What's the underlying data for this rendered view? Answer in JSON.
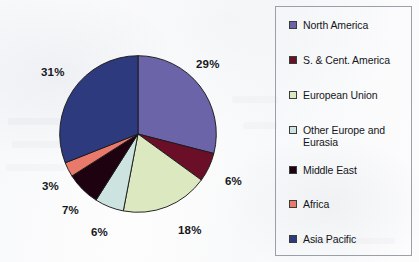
{
  "figure": {
    "kind": "pie-chart-scan",
    "background_color": "#fbfbfc"
  },
  "legend": {
    "position": "right",
    "border_color": "#9aa0a8",
    "items": [
      {
        "label": "North America",
        "color": "#6B64A8",
        "swatch_name": "legend-swatch-north-america"
      },
      {
        "label": "S. & Cent. America",
        "color": "#6B0F28",
        "swatch_name": "legend-swatch-s-cent-america"
      },
      {
        "label": "European Union",
        "color": "#DCE8C0",
        "swatch_name": "legend-swatch-european-union"
      },
      {
        "label": "Other Europe and Eurasia",
        "color": "#CCE3E0",
        "swatch_name": "legend-swatch-other-europe-eurasia"
      },
      {
        "label": "Middle East",
        "color": "#1E0210",
        "swatch_name": "legend-swatch-middle-east"
      },
      {
        "label": "Africa",
        "color": "#E8796B",
        "swatch_name": "legend-swatch-africa"
      },
      {
        "label": "Asia Pacific",
        "color": "#2E3A7E",
        "swatch_name": "legend-swatch-asia-pacific"
      }
    ]
  },
  "labels": {
    "north_america": "29%",
    "s_cent_america": "6%",
    "european_union": "18%",
    "other_europe_and_eurasia": "6%",
    "middle_east": "7%",
    "africa": "3%",
    "asia_pacific": "31%"
  },
  "chart_data": {
    "type": "pie",
    "title": "",
    "subtitle": "",
    "xlabel": "",
    "ylabel": "",
    "units": "percent",
    "start_angle_deg": 0,
    "direction": "clockwise",
    "grid": false,
    "legend_position": "right",
    "categories": [
      "North America",
      "S. & Cent. America",
      "European Union",
      "Other Europe and Eurasia",
      "Middle East",
      "Africa",
      "Asia Pacific"
    ],
    "values": [
      29,
      6,
      18,
      6,
      7,
      3,
      31
    ],
    "data_labels": [
      "29%",
      "6%",
      "18%",
      "6%",
      "7%",
      "3%",
      "31%"
    ],
    "colors": [
      "#6B64A8",
      "#6B0F28",
      "#DCE8C0",
      "#CCE3E0",
      "#1E0210",
      "#E8796B",
      "#2E3A7E"
    ],
    "total": 100,
    "slices": [
      {
        "name": "North America",
        "value": 29,
        "label": "29%",
        "color": "#6B64A8"
      },
      {
        "name": "S. & Cent. America",
        "value": 6,
        "label": "6%",
        "color": "#6B0F28"
      },
      {
        "name": "European Union",
        "value": 18,
        "label": "18%",
        "color": "#DCE8C0"
      },
      {
        "name": "Other Europe and Eurasia",
        "value": 6,
        "label": "6%",
        "color": "#CCE3E0"
      },
      {
        "name": "Middle East",
        "value": 7,
        "label": "7%",
        "color": "#1E0210"
      },
      {
        "name": "Africa",
        "value": 3,
        "label": "3%",
        "color": "#E8796B"
      },
      {
        "name": "Asia Pacific",
        "value": 31,
        "label": "31%",
        "color": "#2E3A7E"
      }
    ]
  }
}
